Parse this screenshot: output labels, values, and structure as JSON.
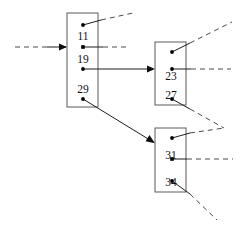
{
  "diagram": {
    "type": "b-tree-node-pointer-diagram",
    "canvas": {
      "width": 243,
      "height": 233,
      "background": "#ffffff"
    },
    "style": {
      "box_stroke": "#5a5a5a",
      "box_fill": "#ffffff",
      "solid_edge_color": "#1c1c1c",
      "dashed_edge_color": "#4a4a4a",
      "dot_color": "#000000",
      "text_color": "#111111"
    },
    "nodes": [
      {
        "id": "root-node",
        "name": "root-node",
        "x": 67,
        "y": 13,
        "width": 31,
        "height": 94,
        "keys": [
          {
            "id": "key-11",
            "value": "11",
            "cx": 83,
            "cy": 36
          },
          {
            "id": "key-19",
            "value": "19",
            "cx": 83,
            "cy": 59
          },
          {
            "id": "key-29",
            "value": "29",
            "cx": 83,
            "cy": 89
          }
        ],
        "ports": [
          {
            "id": "root-port-0",
            "cx": 83,
            "cy": 25,
            "kind": "dashed-out"
          },
          {
            "id": "root-port-1",
            "cx": 83,
            "cy": 47,
            "kind": "dashed-out"
          },
          {
            "id": "root-port-2",
            "cx": 83,
            "cy": 69,
            "kind": "solid-arrow"
          },
          {
            "id": "root-port-3",
            "cx": 83,
            "cy": 99,
            "kind": "solid-arrow"
          }
        ]
      },
      {
        "id": "upper-child-node",
        "name": "upper-child-node",
        "x": 155,
        "y": 42,
        "width": 31,
        "height": 63,
        "keys": [
          {
            "id": "key-23",
            "value": "23",
            "cx": 171,
            "cy": 76
          },
          {
            "id": "key-27",
            "value": "27",
            "cx": 171,
            "cy": 95
          }
        ],
        "ports": [
          {
            "id": "upper-port-0",
            "cx": 172,
            "cy": 52,
            "kind": "dashed-out"
          },
          {
            "id": "upper-port-1",
            "cx": 172,
            "cy": 69,
            "kind": "dashed-out"
          },
          {
            "id": "upper-port-2",
            "cx": 172,
            "cy": 99,
            "kind": "dashed-out"
          }
        ]
      },
      {
        "id": "lower-child-node",
        "name": "lower-child-node",
        "x": 155,
        "y": 128,
        "width": 31,
        "height": 64,
        "keys": [
          {
            "id": "key-31",
            "value": "31",
            "cx": 171,
            "cy": 155
          },
          {
            "id": "key-34",
            "value": "34",
            "cx": 171,
            "cy": 182
          }
        ],
        "ports": [
          {
            "id": "lower-port-0",
            "cx": 172,
            "cy": 138,
            "kind": "dashed-out"
          },
          {
            "id": "lower-port-1",
            "cx": 172,
            "cy": 159,
            "kind": "dashed-out"
          },
          {
            "id": "lower-port-2",
            "cx": 172,
            "cy": 181,
            "kind": "dashed-out"
          }
        ]
      }
    ],
    "edges": [
      {
        "id": "incoming-root-pointer",
        "name": "incoming-root-pointer",
        "style": "dashed-then-solid-arrow",
        "from": "external-left",
        "to": "root-node"
      },
      {
        "id": "edge-root-port0-out",
        "name": "edge-root-port0-out",
        "style": "solid-then-dashed",
        "from": "root-port-0",
        "to": "external-upper-right"
      },
      {
        "id": "edge-root-port1-out",
        "name": "edge-root-port1-out",
        "style": "solid-then-dashed",
        "from": "root-port-1",
        "to": "external-right"
      },
      {
        "id": "edge-root-port2-to-upper-child",
        "name": "edge-root-port2-to-upper-child",
        "style": "solid-arrow",
        "from": "root-port-2",
        "to": "upper-child-node"
      },
      {
        "id": "edge-root-port3-to-lower-child",
        "name": "edge-root-port3-to-lower-child",
        "style": "solid-arrow",
        "from": "root-port-3",
        "to": "lower-child-node"
      },
      {
        "id": "edge-upper-port0-out",
        "name": "edge-upper-port0-out",
        "style": "solid-then-dashed",
        "from": "upper-port-0",
        "to": "external-upper-right"
      },
      {
        "id": "edge-upper-port1-out",
        "name": "edge-upper-port1-out",
        "style": "solid-then-dashed",
        "from": "upper-port-1",
        "to": "external-right"
      },
      {
        "id": "edge-upper-port2-out",
        "name": "edge-upper-port2-out",
        "style": "solid-then-dashed",
        "from": "upper-port-2",
        "to": "external-right-vertex"
      },
      {
        "id": "edge-lower-port0-out",
        "name": "edge-lower-port0-out",
        "style": "solid-then-dashed",
        "from": "lower-port-0",
        "to": "external-right-vertex"
      },
      {
        "id": "edge-lower-port1-out",
        "name": "edge-lower-port1-out",
        "style": "solid-then-dashed",
        "from": "lower-port-1",
        "to": "external-right"
      },
      {
        "id": "edge-lower-port2-out",
        "name": "edge-lower-port2-out",
        "style": "solid-then-dashed",
        "from": "lower-port-2",
        "to": "external-lower-right"
      }
    ]
  }
}
